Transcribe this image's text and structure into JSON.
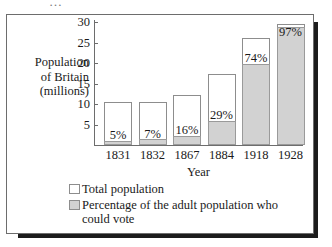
{
  "page": {
    "top_artifact": "…"
  },
  "chart_data": {
    "type": "bar",
    "title": "",
    "xlabel": "Year",
    "ylabel": "Population of Britain (millions)",
    "ylabel_lines": [
      "Population",
      "of Britain",
      "(millions)"
    ],
    "categories": [
      "1831",
      "1832",
      "1867",
      "1884",
      "1918",
      "1928"
    ],
    "ylim": [
      0,
      30
    ],
    "yticks": [
      5,
      10,
      15,
      20,
      25,
      30
    ],
    "ytick_labels": [
      "5",
      "10",
      "15",
      "20",
      "25",
      "30"
    ],
    "grid": false,
    "legend_position": "below",
    "series": [
      {
        "name": "Total population",
        "unit": "millions",
        "values": [
          10.5,
          10.5,
          12.3,
          17.2,
          26.2,
          29.5
        ]
      },
      {
        "name": "Percentage of the adult population who could vote",
        "unit": "millions (voting share drawn to scale)",
        "values": [
          1.0,
          1.4,
          2.3,
          5.9,
          19.8,
          28.9
        ]
      }
    ],
    "data_labels": [
      "5%",
      "7%",
      "16%",
      "29%",
      "74%",
      "97%"
    ],
    "percentages": [
      5,
      7,
      16,
      29,
      74,
      97
    ],
    "colors": {
      "total_fill": "#ffffff",
      "vote_fill": "#d2d2d2",
      "bar_outline": "#8d8d8d",
      "axis": "#6d6d6d",
      "text": "#1a1a1a",
      "frame": "#6d6d6d",
      "shadow": "#1c1c1c"
    }
  },
  "legend": {
    "items": [
      {
        "label": "Total population",
        "swatch": "total"
      },
      {
        "label": "Percentage of the adult population who could vote",
        "swatch": "vote"
      }
    ]
  }
}
